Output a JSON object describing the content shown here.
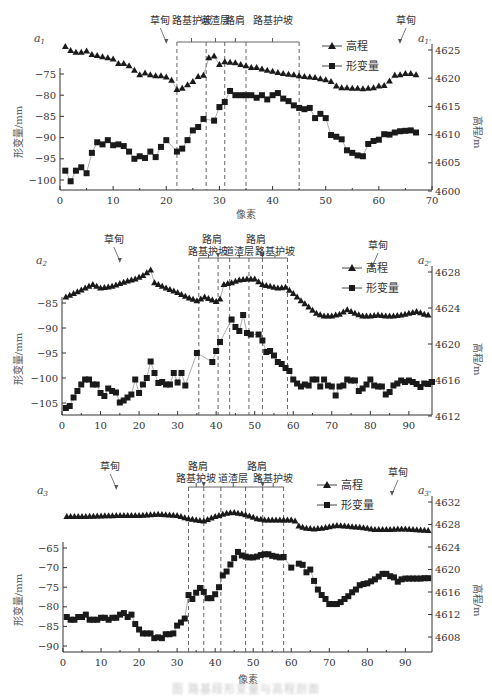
{
  "figure": {
    "caption": "图 路基段形变量与高程剖面"
  },
  "chart_data": [
    {
      "type": "line",
      "panel_label_left": "a1",
      "panel_label_right": "a1'",
      "xlabel": "像素",
      "ylabel_left": "形变量/mm",
      "ylabel_right": "高程/m",
      "xlim": [
        0,
        70
      ],
      "xticks": [
        0,
        10,
        20,
        30,
        40,
        50,
        60,
        70
      ],
      "ylim_left": [
        -103,
        -70
      ],
      "yticks_left": [
        -75,
        -80,
        -85,
        -90,
        -95,
        -100
      ],
      "ylim_right": [
        4600,
        4626
      ],
      "yticks_right": [
        4600,
        4605,
        4610,
        4615,
        4620,
        4625
      ],
      "legend": [
        "高程",
        "形变量"
      ],
      "zones": [
        {
          "label": "草甸",
          "type": "arrow",
          "x": 20
        },
        {
          "label": "路基护坡",
          "from": 22,
          "to": 27.5
        },
        {
          "label": "道渣层",
          "from": 27.5,
          "to": 31
        },
        {
          "label": "路肩",
          "from": 31,
          "to": 35
        },
        {
          "label": "路基护坡",
          "from": 35,
          "to": 45
        },
        {
          "label": "草甸",
          "type": "arrow",
          "x": 58
        }
      ],
      "dividers": [
        22,
        27.5,
        31,
        35,
        45
      ],
      "series": [
        {
          "name": "高程",
          "axis": "right",
          "marker": "triangle",
          "x": [
            1,
            2,
            3,
            4,
            5,
            6,
            7,
            8,
            9,
            10,
            11,
            12,
            13,
            14,
            15,
            16,
            17,
            18,
            19,
            20,
            21,
            22,
            23,
            24,
            25,
            26,
            27,
            28,
            29,
            30,
            31,
            32,
            33,
            34,
            35,
            36,
            37,
            38,
            39,
            40,
            41,
            42,
            43,
            44,
            45,
            46,
            47,
            48,
            49,
            50,
            51,
            52,
            53,
            54,
            55,
            56,
            57,
            58,
            59,
            60,
            61,
            62,
            63,
            64,
            65,
            66,
            67
          ],
          "values": [
            4625.6,
            4624.9,
            4624.6,
            4624.6,
            4624.8,
            4624.2,
            4624,
            4623.8,
            4623.6,
            4623.4,
            4622.6,
            4622.6,
            4622.2,
            4621.4,
            4620.6,
            4620.9,
            4620.6,
            4620.4,
            4620.4,
            4620.2,
            4619.6,
            4618,
            4618.2,
            4618.8,
            4619.4,
            4620.3,
            4620.5,
            4623.6,
            4623.9,
            4622.4,
            4622.9,
            4622.8,
            4622.7,
            4622.4,
            4622.2,
            4621.9,
            4621.9,
            4621.6,
            4621.4,
            4621.2,
            4621,
            4620.8,
            4620.7,
            4620.6,
            4620.4,
            4620.3,
            4620.2,
            4620.1,
            4619.9,
            4619.7,
            4619.4,
            4618.6,
            4618.3,
            4618.3,
            4618.2,
            4618.2,
            4618.1,
            4618.2,
            4618.3,
            4618.6,
            4618.7,
            4619.5,
            4620.5,
            4620.6,
            4620.8,
            4620.8,
            4620.6
          ]
        },
        {
          "name": "形变量",
          "axis": "left",
          "marker": "square",
          "x": [
            1,
            2,
            3,
            4,
            5,
            6,
            7,
            8,
            9,
            10,
            11,
            12,
            13,
            14,
            15,
            16,
            17,
            18,
            19,
            20,
            22,
            23,
            24,
            25,
            26,
            27,
            29,
            30,
            31,
            32,
            33,
            34,
            35,
            36,
            37,
            38,
            39,
            40,
            41,
            42,
            43,
            44,
            45,
            46,
            47,
            48,
            49,
            50,
            51,
            52,
            53,
            54,
            55,
            56,
            57,
            58,
            59,
            60,
            61,
            62,
            63,
            64,
            65,
            66,
            67
          ],
          "values": [
            -97.8,
            -100.3,
            -97.8,
            -97,
            -98.4,
            -93.6,
            -91.1,
            -91.6,
            -90.6,
            -91.8,
            -91.6,
            -92,
            -93.3,
            -95,
            -94.4,
            -94.8,
            -93.3,
            -94.6,
            -92.2,
            -90.6,
            -93.3,
            -92.6,
            -90.6,
            -88.3,
            -87.5,
            -85.6,
            -86,
            -82.8,
            -81.6,
            -79,
            -80,
            -80,
            -80,
            -80,
            -80.6,
            -80,
            -81,
            -80,
            -79.5,
            -80.8,
            -81.4,
            -82.4,
            -83,
            -83.3,
            -83,
            -85.4,
            -84.4,
            -85.4,
            -89.4,
            -89.8,
            -90.4,
            -93,
            -93.6,
            -94.2,
            -94.4,
            -91.5,
            -90.8,
            -90.5,
            -89.2,
            -89.3,
            -88.8,
            -88.5,
            -88.4,
            -88.3,
            -88.8
          ]
        }
      ]
    },
    {
      "type": "line",
      "panel_label_left": "a2",
      "panel_label_right": "a2'",
      "xlabel": "",
      "ylabel_left": "形变量/mm",
      "ylabel_right": "高程/m",
      "xlim": [
        0,
        96
      ],
      "xticks": [
        0,
        10,
        20,
        30,
        40,
        50,
        60,
        70,
        80,
        90
      ],
      "ylim_left": [
        -107.5,
        -78
      ],
      "yticks_left": [
        -85,
        -90,
        -95,
        -100,
        -105
      ],
      "ylim_right": [
        4612,
        4630
      ],
      "yticks_right": [
        4612,
        4616,
        4620,
        4624,
        4628
      ],
      "legend": [
        "高程",
        "形变量"
      ],
      "zones": [
        {
          "label": "草甸",
          "type": "arrow",
          "x": 15
        },
        {
          "label": "路基护坡",
          "from": 35.5,
          "to": 40.5
        },
        {
          "label": "路肩",
          "type": "arrow",
          "x": 40.5
        },
        {
          "label": "道渣层",
          "from": 43.5,
          "to": 48.5
        },
        {
          "label": "路肩",
          "type": "arrow",
          "x": 52
        },
        {
          "label": "路基护坡",
          "from": 52,
          "to": 58.5
        },
        {
          "label": "草甸",
          "type": "arrow",
          "x": 87
        }
      ],
      "dividers": [
        35.5,
        40.5,
        43.5,
        48.5,
        52,
        58.5
      ],
      "series": [
        {
          "name": "高程",
          "axis": "right",
          "marker": "triangle",
          "trend_x": [
            1,
            5,
            8,
            10,
            13,
            15,
            17,
            19,
            21,
            23,
            24,
            25,
            27,
            30,
            33,
            35,
            37,
            40,
            41,
            42,
            44,
            46,
            48,
            50,
            52,
            54,
            56,
            58,
            60,
            62,
            64,
            66,
            68,
            70,
            72,
            74,
            76,
            78,
            80,
            82,
            84,
            86,
            88,
            90,
            92,
            94,
            96
          ],
          "trend_values": [
            4625.2,
            4626,
            4626.6,
            4626.2,
            4626.4,
            4626.7,
            4627,
            4627.2,
            4627.6,
            4628.2,
            4626.8,
            4626.6,
            4626.2,
            4625.7,
            4625.1,
            4624.8,
            4625.2,
            4624.7,
            4625,
            4626.6,
            4626.8,
            4627.1,
            4627.2,
            4627.2,
            4626.6,
            4626.4,
            4626.2,
            4626.3,
            4625.6,
            4624.8,
            4624.1,
            4623.4,
            4623.1,
            4623.1,
            4623.3,
            4623.8,
            4623.4,
            4623.1,
            4623.1,
            4623.2,
            4623.1,
            4623.1,
            4623.2,
            4623.4,
            4623.6,
            4623.3,
            4623.1
          ]
        },
        {
          "name": "形变量",
          "axis": "left",
          "marker": "square",
          "x": [
            1,
            2,
            3,
            4,
            5,
            6,
            7,
            8,
            9,
            10,
            11,
            12,
            13,
            14,
            15,
            16,
            17,
            18,
            19,
            20,
            21,
            22,
            23,
            24,
            25,
            26,
            27,
            28,
            29,
            30,
            31,
            32,
            35,
            39,
            40,
            41,
            44,
            45,
            46,
            47,
            48,
            49,
            51,
            52,
            53,
            54,
            55,
            56,
            57,
            58,
            59,
            60,
            61,
            62,
            63,
            64,
            65,
            66,
            67,
            68,
            69,
            70,
            71,
            72,
            73,
            74,
            75,
            76,
            77,
            78,
            79,
            80,
            81,
            82,
            83,
            84,
            85,
            86,
            87,
            88,
            89,
            90,
            91,
            92,
            93,
            94,
            95,
            96
          ],
          "values": [
            -106,
            -105.6,
            -103.9,
            -102.6,
            -101.3,
            -100.3,
            -100.3,
            -101.3,
            -101.3,
            -103,
            -103.6,
            -102.1,
            -102.6,
            -102.9,
            -104.9,
            -104.5,
            -103.9,
            -103.3,
            -100.3,
            -103,
            -101.3,
            -100,
            -96.7,
            -99,
            -101,
            -100.8,
            -101.3,
            -101.3,
            -99,
            -100.9,
            -99,
            -101.5,
            -95,
            -96.8,
            -94.6,
            -92.8,
            -88.3,
            -89.8,
            -90.6,
            -87.4,
            -91,
            -91.3,
            -91.3,
            -92.5,
            -94.8,
            -94.6,
            -95.5,
            -96.8,
            -97.2,
            -98,
            -98.6,
            -100.3,
            -101.1,
            -101.7,
            -101.3,
            -101.5,
            -100.3,
            -100.3,
            -101.7,
            -100.3,
            -101.5,
            -101.7,
            -103.5,
            -101.7,
            -101.5,
            -100.3,
            -100.5,
            -100.5,
            -102.6,
            -102.1,
            -101.3,
            -100.3,
            -101.5,
            -101.7,
            -101.7,
            -103.3,
            -102.8,
            -101.5,
            -101.1,
            -100.5,
            -100.8,
            -100.5,
            -100.8,
            -101.2,
            -101.8,
            -101.1,
            -101.2,
            -100.8
          ]
        }
      ]
    },
    {
      "type": "line",
      "panel_label_left": "a3",
      "panel_label_right": "a3'",
      "xlabel": "像素",
      "ylabel_left": "形变量/mm",
      "ylabel_right": "高程/m",
      "xlim": [
        0,
        97
      ],
      "xticks": [
        0,
        10,
        20,
        30,
        40,
        50,
        60,
        70,
        80,
        90
      ],
      "ylim_left": [
        -90,
        -63
      ],
      "yticks_left": [
        -65,
        -70,
        -75,
        -80,
        -85,
        -90
      ],
      "ylim_right": [
        4606,
        4634
      ],
      "yticks_right": [
        4608,
        4612,
        4616,
        4620,
        4624,
        4628,
        4632
      ],
      "legend": [
        "高程",
        "形变量"
      ],
      "zones": [
        {
          "label": "草甸",
          "type": "arrow",
          "x": 14
        },
        {
          "label": "路基护坡",
          "from": 33,
          "to": 37
        },
        {
          "label": "路肩",
          "type": "arrow",
          "x": 37
        },
        {
          "label": "道渣层",
          "from": 41.5,
          "to": 48
        },
        {
          "label": "路肩",
          "type": "arrow",
          "x": 52.5
        },
        {
          "label": "路基护坡",
          "from": 52.5,
          "to": 58
        },
        {
          "label": "草甸",
          "type": "arrow",
          "x": 86
        }
      ],
      "dividers": [
        33,
        37,
        41.5,
        48,
        52.5,
        58
      ],
      "series": [
        {
          "name": "高程",
          "axis": "right",
          "marker": "triangle",
          "trend_x": [
            1,
            5,
            10,
            15,
            20,
            25,
            30,
            33,
            35,
            37,
            40,
            43,
            45,
            47,
            49,
            51,
            53,
            55,
            57,
            58,
            60,
            61,
            62,
            64,
            66,
            68,
            70,
            72,
            74,
            76,
            78,
            80,
            82,
            84,
            86,
            88,
            90,
            92,
            94,
            96
          ],
          "trend_values": [
            4629.4,
            4629.4,
            4629.5,
            4629.6,
            4629.6,
            4629.8,
            4629.6,
            4629,
            4628.8,
            4628.6,
            4629.4,
            4630,
            4630.1,
            4629.9,
            4629.5,
            4629,
            4628.8,
            4628.8,
            4628.8,
            4628.8,
            4628.8,
            4628.6,
            4627.7,
            4627.3,
            4627.2,
            4627.3,
            4627.6,
            4627.8,
            4627.7,
            4627.6,
            4627.5,
            4627.3,
            4627.1,
            4627.1,
            4627.1,
            4627.2,
            4627.2,
            4627.1,
            4627.0,
            4626.9
          ]
        },
        {
          "name": "形变量",
          "axis": "left",
          "marker": "square",
          "x": [
            1,
            2,
            3,
            4,
            5,
            6,
            7,
            8,
            9,
            10,
            11,
            12,
            13,
            14,
            15,
            16,
            17,
            18,
            19,
            20,
            21,
            22,
            23,
            24,
            25,
            26,
            27,
            28,
            29,
            30,
            31,
            32,
            33,
            34,
            35,
            36,
            37,
            38,
            39,
            40,
            41,
            42,
            43,
            44,
            45,
            46,
            47,
            48,
            49,
            50,
            51,
            52,
            53,
            54,
            55,
            56,
            57,
            58,
            60,
            62,
            63,
            64,
            65,
            66,
            67,
            68,
            69,
            70,
            71,
            72,
            73,
            74,
            75,
            76,
            77,
            78,
            79,
            80,
            81,
            82,
            83,
            84,
            85,
            86,
            87,
            88,
            89,
            90,
            91,
            92,
            93,
            94,
            95,
            96
          ],
          "values": [
            -82.6,
            -83.3,
            -83.3,
            -82.6,
            -82.6,
            -82,
            -83.3,
            -83.3,
            -83.3,
            -82.8,
            -82.8,
            -83.3,
            -82.8,
            -82.8,
            -82,
            -81.6,
            -82.6,
            -82,
            -84.4,
            -85.8,
            -86.8,
            -86.8,
            -86.8,
            -88,
            -87.8,
            -88,
            -87,
            -87,
            -86.8,
            -84.8,
            -84,
            -83,
            -77,
            -78,
            -76.4,
            -75.2,
            -76.2,
            -77.8,
            -77.8,
            -76.8,
            -75,
            -72,
            -71,
            -69.2,
            -67.6,
            -66,
            -66.9,
            -67.2,
            -67.4,
            -67.4,
            -67.2,
            -66.8,
            -66.6,
            -66.6,
            -67.0,
            -67.2,
            -67.4,
            -67.3,
            -70,
            -69,
            -69.3,
            -71.2,
            -70.5,
            -73.4,
            -75.6,
            -77,
            -78,
            -79.3,
            -79.3,
            -79.3,
            -78.8,
            -78,
            -77.3,
            -76.3,
            -75.6,
            -74.5,
            -74.2,
            -74,
            -73.5,
            -73,
            -72.3,
            -71.6,
            -71.6,
            -72.2,
            -72.5,
            -73.6,
            -73,
            -72.8,
            -72.8,
            -72.8,
            -72.8,
            -72.8,
            -72.7,
            -72.7
          ]
        }
      ]
    }
  ],
  "colors": {
    "marker": "#1a1a1a",
    "line": "#8a8a8a",
    "axis": "#333333",
    "divider": "#555555",
    "text": "#333333"
  }
}
